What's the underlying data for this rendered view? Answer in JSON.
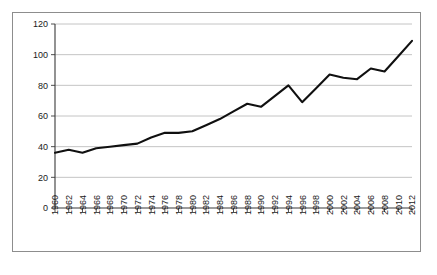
{
  "chart_data": {
    "type": "line",
    "title": "",
    "subtitle": "",
    "xlabel": "",
    "ylabel": "",
    "grid": true,
    "legend": null,
    "legend_position": "none",
    "xlim": [
      1960,
      2012
    ],
    "ylim": [
      0,
      120
    ],
    "ytick_step": 20,
    "xtick_step": 2,
    "line_color": "#101010",
    "grid_color": "#b5b5b5",
    "axis_color": "#3a3a3a",
    "background_color": "#ffffff",
    "border_color": "#8d8d8d",
    "ytick_labels": [
      "0",
      "20",
      "40",
      "60",
      "80",
      "100",
      "120"
    ],
    "ytick_values": [
      0,
      20,
      40,
      60,
      80,
      100,
      120
    ],
    "xtick_labels": [
      "1960",
      "1962",
      "1964",
      "1966",
      "1968",
      "1970",
      "1972",
      "1974",
      "1976",
      "1978",
      "1980",
      "1982",
      "1984",
      "1986",
      "1988",
      "1990",
      "1992",
      "1994",
      "1996",
      "1998",
      "2000",
      "2002",
      "2004",
      "2006",
      "2008",
      "2010",
      "2012"
    ],
    "categories": [
      1960,
      1962,
      1964,
      1966,
      1968,
      1970,
      1972,
      1974,
      1976,
      1978,
      1980,
      1982,
      1984,
      1986,
      1988,
      1990,
      1992,
      1994,
      1996,
      1998,
      2000,
      2002,
      2004,
      2006,
      2008,
      2010,
      2012
    ],
    "values": [
      36,
      38,
      36,
      39,
      40,
      41,
      42,
      46,
      49,
      49,
      50,
      54,
      58,
      63,
      68,
      66,
      73,
      80,
      69,
      78,
      87,
      85,
      84,
      91,
      89,
      99,
      109
    ]
  }
}
